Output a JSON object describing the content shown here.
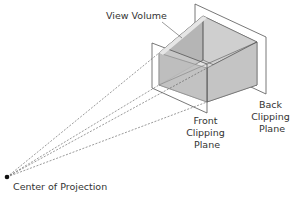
{
  "diagram": {
    "labels": {
      "view_volume": "View Volume",
      "front_clipping_plane": [
        "Front",
        "Clipping",
        "Plane"
      ],
      "back_clipping_plane": [
        "Back",
        "Clipping",
        "Plane"
      ],
      "center_of_projection": "Center of Projection"
    },
    "colors": {
      "outline": "#555555",
      "face_dark": "#9e9e9e",
      "face_mid": "#b9b9b9",
      "face_light": "#d4d4d4",
      "face_top": "#c8c8c8",
      "projection_point": "#111111"
    },
    "projector_style": "dashed"
  }
}
